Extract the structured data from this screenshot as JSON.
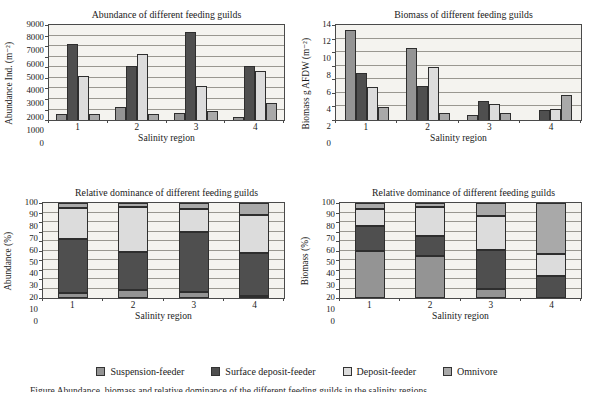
{
  "figure": {
    "caption_cropped": "Figure   Abundance, biomass and relative dominance of the different feeding guilds in the salinity regions"
  },
  "legend": {
    "items": [
      {
        "label": "Suspension-feeder",
        "color": "#949494"
      },
      {
        "label": "Surface deposit-feeder",
        "color": "#4f4f4f"
      },
      {
        "label": "Deposit-feeder",
        "color": "#dcdcdc"
      },
      {
        "label": "Omnivore",
        "color": "#a9a9a9"
      }
    ]
  },
  "chart_data": [
    {
      "id": "abundance",
      "type": "bar",
      "stacked": false,
      "title": "Abundance of different feeding guilds",
      "xlabel": "Salinity region",
      "ylabel": "Abundance Ind. (m⁻²)",
      "categories": [
        "1",
        "2",
        "3",
        "4"
      ],
      "ylim": [
        0,
        9000
      ],
      "ytick_step": 1000,
      "grid": true,
      "series": [
        {
          "name": "Suspension-feeder",
          "values": [
            600,
            1200,
            700,
            250
          ]
        },
        {
          "name": "Surface deposit-feeder",
          "values": [
            7200,
            5100,
            8300,
            5150
          ]
        },
        {
          "name": "Deposit-feeder",
          "values": [
            4200,
            6300,
            3250,
            4650
          ]
        },
        {
          "name": "Omnivore",
          "values": [
            600,
            600,
            850,
            1650
          ]
        }
      ]
    },
    {
      "id": "biomass",
      "type": "bar",
      "stacked": false,
      "title": "Biomass of different feeding guilds",
      "xlabel": "Salinity region",
      "ylabel": "Biomass g AFDW (m⁻²)",
      "categories": [
        "1",
        "2",
        "3",
        "4"
      ],
      "ylim": [
        0,
        14
      ],
      "ytick_step": 2,
      "grid": true,
      "series": [
        {
          "name": "Suspension-feeder",
          "values": [
            13.3,
            10.6,
            0.7,
            0
          ]
        },
        {
          "name": "Surface deposit-feeder",
          "values": [
            7.0,
            5.0,
            2.8,
            1.5
          ]
        },
        {
          "name": "Deposit-feeder",
          "values": [
            4.8,
            7.8,
            2.4,
            1.6
          ]
        },
        {
          "name": "Omnivore",
          "values": [
            1.9,
            1.1,
            1.1,
            3.7
          ]
        }
      ]
    },
    {
      "id": "relative-abundance",
      "type": "bar",
      "stacked": true,
      "title": "Relative dominance of different feeding guilds",
      "xlabel": "Salinity region",
      "ylabel": "Abundance (%)",
      "categories": [
        "1",
        "2",
        "3",
        "4"
      ],
      "ylim": [
        0,
        100
      ],
      "ytick_step": 10,
      "grid": true,
      "series": [
        {
          "name": "Suspension-feeder",
          "values": [
            5,
            9,
            6,
            2
          ]
        },
        {
          "name": "Surface deposit-feeder",
          "values": [
            57,
            39,
            63,
            45
          ]
        },
        {
          "name": "Deposit-feeder",
          "values": [
            33,
            48,
            25,
            40
          ]
        },
        {
          "name": "Omnivore",
          "values": [
            5,
            4,
            6,
            13
          ]
        }
      ]
    },
    {
      "id": "relative-biomass",
      "type": "bar",
      "stacked": true,
      "title": "Relative dominance of different feeding guilds",
      "xlabel": "Salinity region",
      "ylabel": "Biomass (%)",
      "categories": [
        "1",
        "2",
        "3",
        "4"
      ],
      "ylim": [
        0,
        100
      ],
      "ytick_step": 10,
      "grid": true,
      "series": [
        {
          "name": "Suspension-feeder",
          "values": [
            49,
            44,
            10,
            0
          ]
        },
        {
          "name": "Surface deposit-feeder",
          "values": [
            27,
            21,
            41,
            23
          ]
        },
        {
          "name": "Deposit-feeder",
          "values": [
            18,
            31,
            35,
            23
          ]
        },
        {
          "name": "Omnivore",
          "values": [
            6,
            4,
            14,
            54
          ]
        }
      ]
    }
  ]
}
